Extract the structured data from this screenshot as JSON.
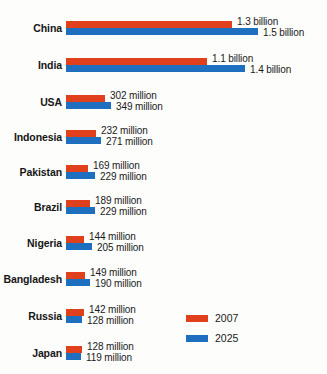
{
  "chart_data": {
    "type": "bar",
    "title": "",
    "xlabel": "",
    "ylabel": "",
    "orientation": "horizontal",
    "grid": false,
    "legend_position": "bottom-right",
    "categories": [
      "China",
      "India",
      "USA",
      "Indonesia",
      "Pakistan",
      "Brazil",
      "Nigeria",
      "Bangladesh",
      "Russia",
      "Japan"
    ],
    "series": [
      {
        "name": "2007",
        "color": "#e0401c",
        "values": [
          1300,
          1100,
          302,
          232,
          169,
          189,
          144,
          149,
          142,
          128
        ],
        "labels": [
          "1.3 billion",
          "1.1 billion",
          "302 million",
          "232 million",
          "169 million",
          "189 million",
          "144 million",
          "149 million",
          "142 million",
          "128 million"
        ]
      },
      {
        "name": "2025",
        "color": "#1e6fc0",
        "values": [
          1500,
          1400,
          349,
          271,
          229,
          229,
          205,
          190,
          128,
          119
        ],
        "labels": [
          "1.5 billion",
          "1.4 billion",
          "349 million",
          "271 million",
          "229 million",
          "229 million",
          "205 million",
          "190 million",
          "128 million",
          "119 million"
        ]
      }
    ],
    "units": "millions of people",
    "xlim": [
      0,
      1500
    ]
  },
  "legend": {
    "items": [
      {
        "label": "2007",
        "color": "#e0401c"
      },
      {
        "label": "2025",
        "color": "#1e6fc0"
      }
    ]
  }
}
